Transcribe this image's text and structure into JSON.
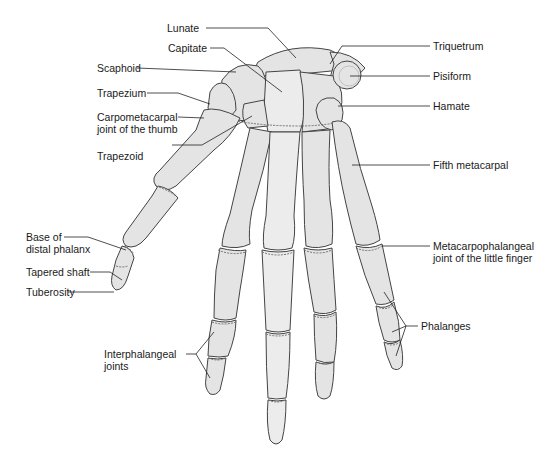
{
  "figure": {
    "background": "#ffffff",
    "bone_fill": "#e4e4e4",
    "outline": "#444444"
  },
  "labels": {
    "lunate": "Lunate",
    "capitate": "Capitate",
    "scaphoid": "Scaphoid",
    "trapezium": "Trapezium",
    "cmc_thumb_line1": "Carpometacarpal",
    "cmc_thumb_line2": "joint of the thumb",
    "trapezoid": "Trapezoid",
    "triquetrum": "Triquetrum",
    "pisiform": "Pisiform",
    "hamate": "Hamate",
    "fifth_metacarpal": "Fifth metacarpal",
    "base_distal_line1": "Base of",
    "base_distal_line2": "distal phalanx",
    "tapered_shaft": "Tapered shaft",
    "tuberosity": "Tuberosity",
    "mcp_line1": "Metacarpophalangeal",
    "mcp_line2": "joint of the little finger",
    "phalanges": "Phalanges",
    "interphalangeal_line1": "Interphalangeal",
    "interphalangeal_line2": "joints"
  }
}
